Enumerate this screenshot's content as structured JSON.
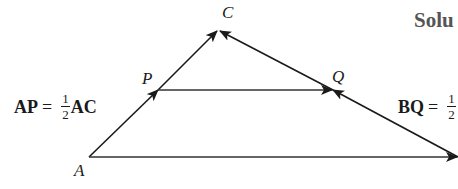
{
  "diagram": {
    "type": "triangle-vector-diagram",
    "points": {
      "A": {
        "label": "A",
        "x": 89,
        "y": 157
      },
      "B": {
        "label": "B",
        "x": 458,
        "y": 157
      },
      "C": {
        "label": "C",
        "x": 218,
        "y": 30
      },
      "P": {
        "label": "P",
        "x": 158,
        "y": 90
      },
      "Q": {
        "label": "Q",
        "x": 333,
        "y": 90
      }
    },
    "vectors": [
      {
        "from": "A",
        "to": "C",
        "arrow_mid": "P"
      },
      {
        "from": "B",
        "to": "C",
        "arrow_mid": "Q"
      },
      {
        "from": "P",
        "to": "Q"
      },
      {
        "from": "A",
        "to": "B"
      }
    ],
    "equations": {
      "left": {
        "lhs": "AP",
        "eq": "=",
        "num": "1",
        "den": "2",
        "rhs": "AC"
      },
      "right": {
        "lhs": "BQ",
        "eq": "=",
        "num": "1",
        "den": "2"
      }
    },
    "heading": "Solu",
    "colors": {
      "stroke": "#1a1a1a",
      "heading": "#555555"
    }
  }
}
